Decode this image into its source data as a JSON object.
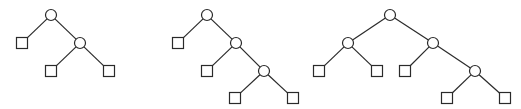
{
  "diagram": {
    "type": "binary-trees",
    "background": "#ffffff",
    "stroke_color": "#2a2a2a",
    "internal_node_shape": "circle",
    "leaf_node_shape": "square",
    "node_radius": 5.5,
    "leaf_size": 11,
    "trees": [
      {
        "name": "tree-1",
        "internal_nodes": [
          {
            "id": "a",
            "x": 51,
            "y": 15
          },
          {
            "id": "b",
            "x": 80,
            "y": 43
          }
        ],
        "leaves": [
          {
            "id": "l1",
            "x": 22,
            "y": 43
          },
          {
            "id": "l2",
            "x": 51,
            "y": 71
          },
          {
            "id": "l3",
            "x": 109,
            "y": 71
          }
        ],
        "edges": [
          [
            "a",
            "l1"
          ],
          [
            "a",
            "b"
          ],
          [
            "b",
            "l2"
          ],
          [
            "b",
            "l3"
          ]
        ]
      },
      {
        "name": "tree-2",
        "internal_nodes": [
          {
            "id": "a",
            "x": 207,
            "y": 15
          },
          {
            "id": "b",
            "x": 236,
            "y": 43
          },
          {
            "id": "c",
            "x": 264,
            "y": 71
          }
        ],
        "leaves": [
          {
            "id": "l1",
            "x": 178,
            "y": 43
          },
          {
            "id": "l2",
            "x": 207,
            "y": 71
          },
          {
            "id": "l3",
            "x": 235,
            "y": 98
          },
          {
            "id": "l4",
            "x": 293,
            "y": 98
          }
        ],
        "edges": [
          [
            "a",
            "l1"
          ],
          [
            "a",
            "b"
          ],
          [
            "b",
            "l2"
          ],
          [
            "b",
            "c"
          ],
          [
            "c",
            "l3"
          ],
          [
            "c",
            "l4"
          ]
        ]
      },
      {
        "name": "tree-3",
        "internal_nodes": [
          {
            "id": "a",
            "x": 390,
            "y": 15
          },
          {
            "id": "b",
            "x": 348,
            "y": 43
          },
          {
            "id": "c",
            "x": 433,
            "y": 43
          },
          {
            "id": "d",
            "x": 475,
            "y": 71
          }
        ],
        "leaves": [
          {
            "id": "l1",
            "x": 319,
            "y": 71
          },
          {
            "id": "l2",
            "x": 377,
            "y": 71
          },
          {
            "id": "l3",
            "x": 405,
            "y": 71
          },
          {
            "id": "l4",
            "x": 447,
            "y": 98
          },
          {
            "id": "l5",
            "x": 505,
            "y": 98
          }
        ],
        "edges": [
          [
            "a",
            "b"
          ],
          [
            "a",
            "c"
          ],
          [
            "b",
            "l1"
          ],
          [
            "b",
            "l2"
          ],
          [
            "c",
            "l3"
          ],
          [
            "c",
            "d"
          ],
          [
            "d",
            "l4"
          ],
          [
            "d",
            "l5"
          ]
        ]
      }
    ]
  }
}
